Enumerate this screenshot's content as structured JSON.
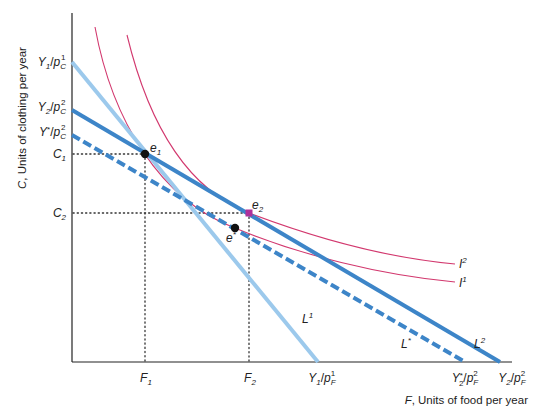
{
  "diagram": {
    "y_axis_title": {
      "var": "C",
      "rest": ", Units of clothing per year"
    },
    "x_axis_title": {
      "var": "F",
      "rest": ", Units of food per year"
    },
    "y_ticks": [
      {
        "id": "y1-pc1",
        "main": "Y",
        "sub": "1",
        "sep": "/",
        "p": "p",
        "psub": "C",
        "psup": "1",
        "y": 62
      },
      {
        "id": "y2-pc2",
        "main": "Y",
        "sub": "2",
        "sep": "/",
        "p": "p",
        "psub": "C",
        "psup": "2",
        "y": 110
      },
      {
        "id": "ystar-pc2",
        "main": "Y",
        "sup": "*",
        "sep": "/",
        "p": "p",
        "psub": "C",
        "psup": "2",
        "y": 135
      },
      {
        "id": "c1",
        "main": "C",
        "sub": "1",
        "y": 154
      },
      {
        "id": "c2",
        "main": "C",
        "sub": "2",
        "y": 213
      }
    ],
    "x_ticks": [
      {
        "id": "f1",
        "main": "F",
        "sub": "1",
        "x": 145
      },
      {
        "id": "f2",
        "main": "F",
        "sub": "2",
        "x": 249
      },
      {
        "id": "y1-pf1",
        "main": "Y",
        "sub": "1",
        "sep": "/",
        "p": "p",
        "psub": "F",
        "psup": "1",
        "x": 318
      },
      {
        "id": "y2star-pf2",
        "main": "Y",
        "sub": "2",
        "sup": "*",
        "sep": "/",
        "p": "p",
        "psub": "F",
        "psup": "2",
        "x": 465
      },
      {
        "id": "y2-pf2",
        "main": "Y",
        "sub": "2",
        "sep": "/",
        "p": "p",
        "psub": "F",
        "psup": "2",
        "x": 500
      }
    ],
    "budget_lines": [
      {
        "name": "L",
        "sup": "1",
        "color": "#9cc9ec",
        "style": "solid",
        "from": [
          72,
          62
        ],
        "to": [
          318,
          362
        ],
        "label_pos": [
          300,
          318
        ]
      },
      {
        "name": "L",
        "sup": "2",
        "color": "#3d85c8",
        "style": "solid",
        "from": [
          72,
          110
        ],
        "to": [
          500,
          362
        ],
        "label_pos": [
          474,
          345
        ]
      },
      {
        "name": "L",
        "sup": "*",
        "color": "#3d85c8",
        "style": "dashed",
        "from": [
          72,
          135
        ],
        "to": [
          465,
          362
        ],
        "label_pos": [
          408,
          345
        ]
      }
    ],
    "indifference_curves": [
      {
        "name": "I",
        "sup": "1",
        "color": "#d2386e",
        "label_pos": [
          458,
          285
        ]
      },
      {
        "name": "I",
        "sup": "2",
        "color": "#d2386e",
        "label_pos": [
          458,
          267
        ]
      }
    ],
    "points": [
      {
        "name": "e",
        "sub": "1",
        "x": 145,
        "y": 154,
        "color": "#111111"
      },
      {
        "name": "e",
        "sub": "2",
        "x": 249,
        "y": 213,
        "color": "#b0309a"
      },
      {
        "name": "e",
        "sup": "*",
        "x": 235,
        "y": 228,
        "color": "#111111"
      }
    ],
    "colors": {
      "axis": "#222222",
      "guide": "#333333",
      "light_blue": "#9cc9ec",
      "blue": "#3d85c8",
      "magenta": "#d2386e"
    }
  }
}
